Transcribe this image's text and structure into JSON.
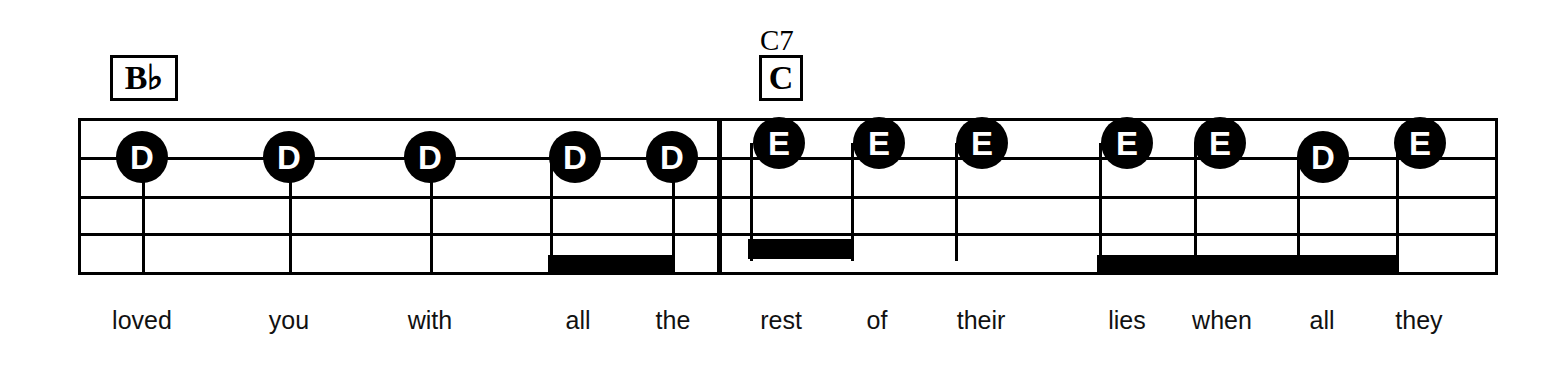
{
  "sheet": {
    "width": 1550,
    "height": 365,
    "background": "#ffffff",
    "ink": "#000000",
    "type": "guitar-tab-lead-sheet-excerpt"
  },
  "chords": [
    {
      "id": "chord-bb",
      "boxed_label": "B♭",
      "above_label": "",
      "x": 110,
      "y": 55,
      "width": 68,
      "height": 46,
      "font_size": 34
    },
    {
      "id": "chord-c7",
      "boxed_label": "C",
      "above_label": "C7",
      "above_x": 760,
      "above_y": 26,
      "x": 759,
      "y": 55,
      "width": 44,
      "height": 46,
      "font_size": 34
    }
  ],
  "staff": {
    "left": 78,
    "right": 1495,
    "line_y": [
      118,
      157,
      196,
      233,
      272
    ],
    "line_count": 5,
    "line_thickness": 3
  },
  "barlines": [
    {
      "id": "barline-1",
      "x": 717,
      "thickness": 5,
      "kind": "heavy"
    }
  ],
  "notes": [
    {
      "id": "n1",
      "label": "D",
      "x": 142,
      "cy": 157,
      "r": 26,
      "stem_to": 272,
      "lyric": "loved"
    },
    {
      "id": "n2",
      "label": "D",
      "x": 289,
      "cy": 157,
      "r": 26,
      "stem_to": 272,
      "lyric": "you"
    },
    {
      "id": "n3",
      "label": "D",
      "x": 430,
      "cy": 157,
      "r": 26,
      "stem_to": 272,
      "lyric": "with"
    },
    {
      "id": "n4",
      "label": "D",
      "x": 575,
      "cy": 157,
      "r": 26,
      "stem_to": 272,
      "lyric": "all"
    },
    {
      "id": "n5",
      "label": "D",
      "x": 672,
      "cy": 157,
      "r": 26,
      "stem_to": 272,
      "lyric": "the"
    },
    {
      "id": "n6",
      "label": "E",
      "x": 779,
      "cy": 143,
      "r": 26,
      "stem_to": 265,
      "lyric": "rest"
    },
    {
      "id": "n7",
      "label": "E",
      "x": 879,
      "cy": 143,
      "r": 26,
      "stem_to": 265,
      "lyric": "of"
    },
    {
      "id": "n8",
      "label": "E",
      "x": 982,
      "cy": 143,
      "r": 26,
      "stem_to": 265,
      "lyric": "their"
    },
    {
      "id": "n9",
      "label": "E",
      "x": 1127,
      "cy": 143,
      "r": 26,
      "stem_to": 272,
      "lyric": "lies"
    },
    {
      "id": "n10",
      "label": "E",
      "x": 1220,
      "cy": 143,
      "r": 26,
      "stem_to": 272,
      "lyric": "when"
    },
    {
      "id": "n11",
      "label": "D",
      "x": 1323,
      "cy": 157,
      "r": 26,
      "stem_to": 272,
      "lyric": "all"
    },
    {
      "id": "n12",
      "label": "E",
      "x": 1420,
      "cy": 143,
      "r": 26,
      "stem_to": 272,
      "lyric": "they"
    }
  ],
  "beams": [
    {
      "id": "beam-all-the",
      "x1": 548,
      "x2": 674,
      "y": 255,
      "thickness": 17
    },
    {
      "id": "beam-rest-of",
      "x1": 748,
      "x2": 853,
      "y": 239,
      "thickness": 20
    },
    {
      "id": "beam-lies-all",
      "x1": 1097,
      "x2": 1398,
      "y": 255,
      "thickness": 19
    }
  ],
  "lyrics": {
    "baseline_y": 308,
    "line": "loved you with all the rest of their lies when all they",
    "words": [
      {
        "text": "loved",
        "x": 142
      },
      {
        "text": "you",
        "x": 289
      },
      {
        "text": "with",
        "x": 430
      },
      {
        "text": "all",
        "x": 578
      },
      {
        "text": "the",
        "x": 673
      },
      {
        "text": "rest",
        "x": 781
      },
      {
        "text": "of",
        "x": 877
      },
      {
        "text": "their",
        "x": 981
      },
      {
        "text": "lies",
        "x": 1127
      },
      {
        "text": "when",
        "x": 1222
      },
      {
        "text": "all",
        "x": 1322
      },
      {
        "text": "they",
        "x": 1419
      }
    ]
  }
}
